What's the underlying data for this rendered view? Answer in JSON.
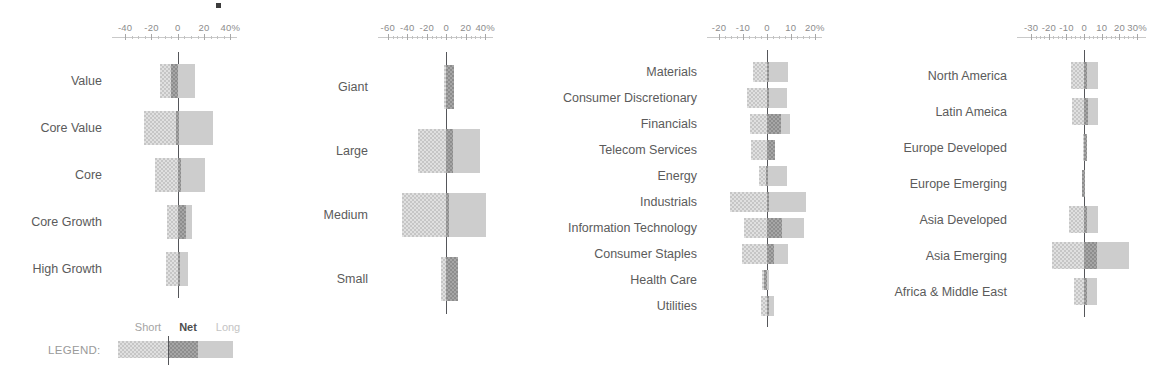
{
  "legend": {
    "title": "LEGEND:",
    "short_label": "Short",
    "net_label": "Net",
    "long_label": "Long",
    "short_value": -25,
    "net_value": 8,
    "long_value": 32
  },
  "colors": {
    "short": "#c6c6c6",
    "long": "#cdcdcd",
    "net": "#8d8d8d",
    "zero_line": "#55565a",
    "label_text": "#5b5b5b",
    "axis_text": "#8d8d8d"
  },
  "chart_data": [
    {
      "type": "bar",
      "orientation": "horizontal",
      "title": "",
      "xlabel": "",
      "ylabel": "",
      "axis_suffix": "%",
      "xlim": [
        -50,
        45
      ],
      "ticks": [
        -40,
        -20,
        0,
        20,
        40
      ],
      "tick_labels": [
        "-40",
        "-20",
        "0",
        "20",
        "40%"
      ],
      "grid": false,
      "categories": [
        "Value",
        "Core Value",
        "Core",
        "Core Growth",
        "High Growth"
      ],
      "series": [
        {
          "name": "Short",
          "values": [
            -13.5,
            -25.5,
            -17.5,
            -8.5,
            -9.0
          ]
        },
        {
          "name": "Net",
          "values": [
            -5.0,
            -1.0,
            2.5,
            6.0,
            0.5
          ]
        },
        {
          "name": "Long",
          "values": [
            13.0,
            27.0,
            21.0,
            10.5,
            8.0
          ]
        }
      ]
    },
    {
      "type": "bar",
      "orientation": "horizontal",
      "title": "",
      "xlabel": "",
      "ylabel": "",
      "axis_suffix": "%",
      "xlim": [
        -70,
        48
      ],
      "ticks": [
        -60,
        -40,
        -20,
        0,
        20,
        40
      ],
      "tick_labels": [
        "-60",
        "-40",
        "-20",
        "0",
        "20",
        "40%"
      ],
      "grid": false,
      "categories": [
        "Giant",
        "Large",
        "Medium",
        "Small"
      ],
      "series": [
        {
          "name": "Short",
          "values": [
            -2.0,
            -29.0,
            -45.0,
            -5.5
          ]
        },
        {
          "name": "Net",
          "values": [
            7.5,
            7.0,
            0.5,
            12.5
          ]
        },
        {
          "name": "Long",
          "values": [
            7.5,
            35.0,
            41.0,
            12.5
          ]
        }
      ]
    },
    {
      "type": "bar",
      "orientation": "horizontal",
      "title": "",
      "xlabel": "",
      "ylabel": "",
      "axis_suffix": "%",
      "xlim": [
        -25,
        23
      ],
      "ticks": [
        -20,
        -10,
        0,
        10,
        20
      ],
      "tick_labels": [
        "-20",
        "-10",
        "0",
        "10",
        "20%"
      ],
      "grid": false,
      "categories": [
        "Materials",
        "Consumer Discretionary",
        "Financials",
        "Telecom Services",
        "Energy",
        "Industrials",
        "Information Technology",
        "Consumer Staples",
        "Health Care",
        "Utilities"
      ],
      "series": [
        {
          "name": "Short",
          "values": [
            -6.0,
            -8.5,
            -7.0,
            -6.5,
            -3.5,
            -15.5,
            -9.5,
            -10.5,
            -2.0,
            -2.5
          ]
        },
        {
          "name": "Net",
          "values": [
            0.5,
            0.3,
            6.0,
            3.5,
            -0.4,
            0.2,
            6.5,
            3.0,
            -1.3,
            0.2
          ]
        },
        {
          "name": "Long",
          "values": [
            9.0,
            8.5,
            9.5,
            3.5,
            8.5,
            16.5,
            15.5,
            9.0,
            1.0,
            3.0
          ]
        }
      ]
    },
    {
      "type": "bar",
      "orientation": "horizontal",
      "title": "",
      "xlabel": "",
      "ylabel": "",
      "axis_suffix": "%",
      "xlim": [
        -38,
        35
      ],
      "ticks": [
        -30,
        -20,
        -10,
        0,
        10,
        20,
        30
      ],
      "tick_labels": [
        "-30",
        "-20",
        "-10",
        "0",
        "10",
        "20",
        "30%"
      ],
      "grid": false,
      "categories": [
        "North America",
        "Latin Ameica",
        "Europe Developed",
        "Europe Emerging",
        "Asia Developed",
        "Asia Emerging",
        "Africa & Middle East"
      ],
      "series": [
        {
          "name": "Short",
          "values": [
            -7.5,
            -7.0,
            -0.5,
            -1.0,
            -8.5,
            -18.0,
            -6.0
          ]
        },
        {
          "name": "Net",
          "values": [
            0.4,
            2.0,
            1.5,
            -1.0,
            0.3,
            7.0,
            1.8
          ]
        },
        {
          "name": "Long",
          "values": [
            8.0,
            8.0,
            1.5,
            0.2,
            8.0,
            25.5,
            7.5
          ]
        }
      ]
    }
  ]
}
